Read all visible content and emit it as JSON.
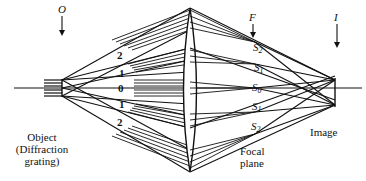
{
  "diagram": {
    "planes": {
      "object_marker": "O",
      "focal_marker": "F",
      "image_marker": "I"
    },
    "labels": {
      "object_line1": "Object",
      "object_line2": "(Diffraction",
      "object_line3": "grating)",
      "focal_line1": "Focal",
      "focal_line2": "plane",
      "image": "Image"
    },
    "orders": [
      "2",
      "1",
      "0",
      "1̄",
      "2"
    ],
    "spots": [
      {
        "letter": "S",
        "sub": "2"
      },
      {
        "letter": "S",
        "sub": "1"
      },
      {
        "letter": "S",
        "sub": "0"
      },
      {
        "letter": "S",
        "sub": "1"
      },
      {
        "letter": "S",
        "sub": "2"
      }
    ],
    "colors": {
      "ink": "#111111",
      "background": "#ffffff"
    }
  }
}
